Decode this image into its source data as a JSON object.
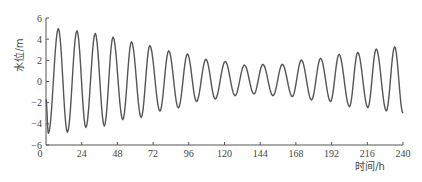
{
  "chart_data": {
    "type": "line",
    "title": "",
    "xlabel": "时间/h",
    "ylabel": "水位/m",
    "xlim": [
      0,
      240
    ],
    "ylim": [
      -6,
      6
    ],
    "xticks": [
      0,
      24,
      48,
      72,
      96,
      120,
      144,
      168,
      192,
      216,
      240
    ],
    "yticks": [
      -6,
      -4,
      -2,
      0,
      2,
      4,
      6
    ],
    "grid": false,
    "legend": null,
    "series": [
      {
        "name": "水位",
        "color": "#555555",
        "extrema": [
          {
            "t": 0.0,
            "v": -1.7
          },
          {
            "t": 1.6,
            "v": -4.9
          },
          {
            "t": 8.3,
            "v": 5.0
          },
          {
            "t": 14.4,
            "v": -4.8
          },
          {
            "t": 20.8,
            "v": 4.8
          },
          {
            "t": 26.8,
            "v": -4.35
          },
          {
            "t": 33.1,
            "v": 4.55
          },
          {
            "t": 39.2,
            "v": -4.2
          },
          {
            "t": 45.1,
            "v": 4.2
          },
          {
            "t": 51.6,
            "v": -3.6
          },
          {
            "t": 57.5,
            "v": 3.75
          },
          {
            "t": 64.0,
            "v": -3.4
          },
          {
            "t": 69.8,
            "v": 3.4
          },
          {
            "t": 76.6,
            "v": -2.8
          },
          {
            "t": 82.5,
            "v": 2.9
          },
          {
            "t": 89.0,
            "v": -2.5
          },
          {
            "t": 95.1,
            "v": 2.6
          },
          {
            "t": 101.2,
            "v": -1.9
          },
          {
            "t": 107.5,
            "v": 2.1
          },
          {
            "t": 113.8,
            "v": -1.65
          },
          {
            "t": 120.5,
            "v": 1.9
          },
          {
            "t": 127.1,
            "v": -1.34
          },
          {
            "t": 133.4,
            "v": 1.56
          },
          {
            "t": 139.8,
            "v": -1.18
          },
          {
            "t": 145.8,
            "v": 1.62
          },
          {
            "t": 152.6,
            "v": -1.34
          },
          {
            "t": 158.9,
            "v": 1.62
          },
          {
            "t": 165.6,
            "v": -1.43
          },
          {
            "t": 171.7,
            "v": 2.03
          },
          {
            "t": 178.5,
            "v": -1.75
          },
          {
            "t": 184.6,
            "v": 2.19
          },
          {
            "t": 191.3,
            "v": -1.9
          },
          {
            "t": 197.0,
            "v": 2.57
          },
          {
            "t": 204.0,
            "v": -2.38
          },
          {
            "t": 209.6,
            "v": 2.75
          },
          {
            "t": 216.4,
            "v": -2.47
          },
          {
            "t": 222.0,
            "v": 3.07
          },
          {
            "t": 228.8,
            "v": -2.78
          },
          {
            "t": 234.4,
            "v": 3.28
          },
          {
            "t": 240.0,
            "v": -3.0
          }
        ]
      }
    ]
  },
  "axes": {
    "x_title": "时间/h",
    "y_title": "水位/m",
    "x_tick_labels": [
      "0",
      "24",
      "48",
      "72",
      "96",
      "120",
      "144",
      "168",
      "192",
      "216",
      "240"
    ],
    "y_tick_labels": [
      "6",
      "4",
      "2",
      "0",
      "−2",
      "−4",
      "−6"
    ]
  }
}
